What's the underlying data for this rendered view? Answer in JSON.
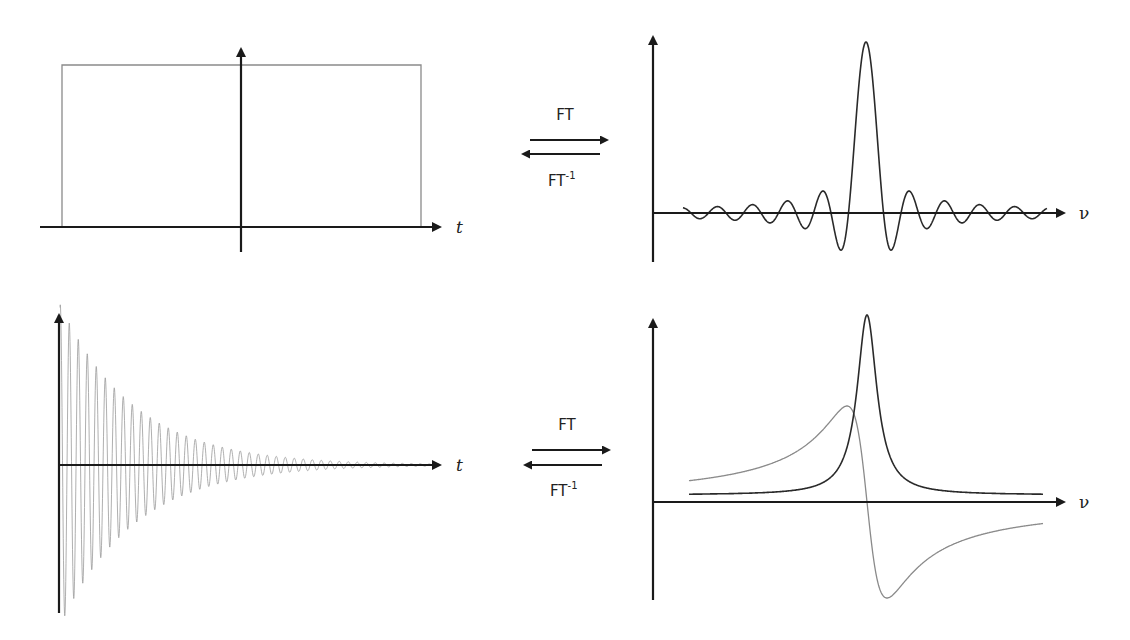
{
  "figure": {
    "top_row": {
      "left_axis_label": "t",
      "right_axis_label": "ν",
      "forward_label": "FT",
      "inverse_label": "FT",
      "inverse_superscript": "-1"
    },
    "bottom_row": {
      "left_axis_label": "t",
      "right_axis_label": "ν",
      "forward_label": "FT",
      "inverse_label": "FT",
      "inverse_superscript": "-1"
    }
  },
  "colors": {
    "axis": "#1a1a1a",
    "gray_curve": "#8a8a8a",
    "dark_curve": "#2a2a2a"
  },
  "chart_data": [
    {
      "type": "line",
      "title": "Rectangular pulse (time domain)",
      "xlabel": "t",
      "ylabel": "",
      "description": "Boxcar function, constant amplitude between -T/2 and +T/2, zero elsewhere",
      "x": [
        -1,
        -1,
        1,
        1
      ],
      "y": [
        0,
        1,
        1,
        0
      ],
      "series": [
        {
          "name": "rect(t)",
          "color": "#8a8a8a"
        }
      ]
    },
    {
      "type": "line",
      "title": "Sinc function (frequency domain)",
      "xlabel": "ν",
      "ylabel": "",
      "description": "sin(x)/x with central main lobe and decaying sidelobes",
      "params": {
        "center_px": 866,
        "zero_spacing_px": 17.5,
        "peak_height_px": 171,
        "x_start_px": 683,
        "x_end_px": 1047
      },
      "series": [
        {
          "name": "sinc(ν)",
          "color": "#2a2a2a"
        }
      ]
    },
    {
      "type": "line",
      "title": "Free induction decay (time domain)",
      "xlabel": "t",
      "ylabel": "",
      "description": "Exponentially decaying cosine oscillation",
      "params": {
        "t0_px": 59,
        "amplitude_px": 163,
        "period_px": 9,
        "decay_px": 74,
        "x_end_px": 440
      },
      "series": [
        {
          "name": "FID(t)",
          "color": "#9a9a9a"
        }
      ]
    },
    {
      "type": "line",
      "title": "Lorentzian absorption and dispersion (frequency domain)",
      "xlabel": "ν",
      "ylabel": "",
      "description": "Absorption (dark) Lorentzian peak and dispersion (gray) lineshape",
      "params": {
        "center_px": 867,
        "x_start_px": 689,
        "x_end_px": 1043
      },
      "series": [
        {
          "name": "Absorption",
          "color": "#2a2a2a",
          "height_px": 180,
          "half_width_px": 12,
          "baseline_offset_px": 7
        },
        {
          "name": "Dispersion",
          "color": "#8a8a8a",
          "amplitude_px": 192,
          "half_width_px": 20
        }
      ]
    }
  ]
}
